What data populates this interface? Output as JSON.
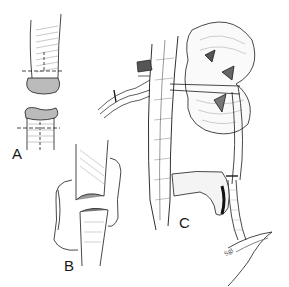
{
  "figure": {
    "labels": {
      "a": "A",
      "b": "B",
      "c": "C"
    },
    "signature": "Sgt",
    "colors": {
      "ink": "#1a1a1a",
      "shade": "#555555",
      "background": "#ffffff"
    }
  }
}
